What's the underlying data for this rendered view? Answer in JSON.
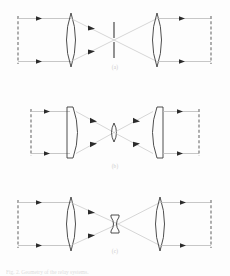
{
  "figure": {
    "caption": "Fig. 2. Geometry of the relay systems.",
    "background_color": "#fdfdfd",
    "ray_color": "#b9b9b9",
    "outline_color": "#3a3a3a",
    "dashed_color": "#9a9a9a",
    "label_color": "#c9c9c9"
  },
  "panels": [
    {
      "id": "panel-a",
      "label": "(a)",
      "left_element": {
        "name": "object-plane",
        "type": "dashed-line"
      },
      "first_lens": {
        "name": "biconvex-lens",
        "type": "biconvex"
      },
      "center_element": {
        "name": "field-stop",
        "type": "stop"
      },
      "second_lens": {
        "name": "biconvex-lens",
        "type": "biconvex"
      },
      "right_element": {
        "name": "image-plane",
        "type": "dashed-line"
      },
      "ray_count": 2
    },
    {
      "id": "panel-b",
      "label": "(b)",
      "left_element": {
        "name": "object-plane",
        "type": "dashed-line"
      },
      "first_lens": {
        "name": "plano-convex-lens",
        "type": "plano-convex"
      },
      "center_element": {
        "name": "field-lens",
        "type": "small-biconvex"
      },
      "second_lens": {
        "name": "plano-convex-lens",
        "type": "plano-convex"
      },
      "right_element": {
        "name": "image-plane",
        "type": "dashed-line"
      },
      "ray_count": 2
    },
    {
      "id": "panel-c",
      "label": "(c)",
      "left_element": {
        "name": "object-plane",
        "type": "dashed-line"
      },
      "first_lens": {
        "name": "biconvex-lens",
        "type": "biconvex"
      },
      "center_element": {
        "name": "biconcave-field-lens",
        "type": "small-biconcave"
      },
      "second_lens": {
        "name": "biconvex-lens",
        "type": "biconvex"
      },
      "right_element": {
        "name": "image-plane",
        "type": "dashed-line"
      },
      "ray_count": 2
    }
  ]
}
